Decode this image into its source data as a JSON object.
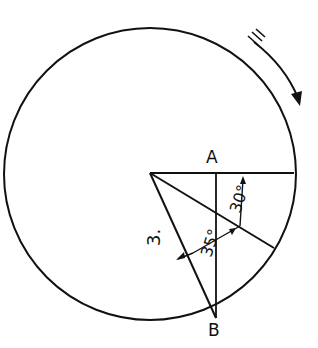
{
  "diagram": {
    "type": "geometry",
    "stroke_color": "#111111",
    "background": "#ffffff",
    "circle": {
      "cx": 150,
      "cy": 174,
      "r": 146
    },
    "points": {
      "A": {
        "label": "A",
        "x": 216,
        "y": 173
      },
      "B": {
        "label": "B",
        "x": 216,
        "y": 318
      }
    },
    "labels": {
      "point_a": "A",
      "point_b": "B",
      "angle_upper": "30°",
      "angle_lower": "35°",
      "side_label": "3."
    },
    "rotation_arrow": {
      "direction": "clockwise",
      "hash_marks": 3
    }
  }
}
